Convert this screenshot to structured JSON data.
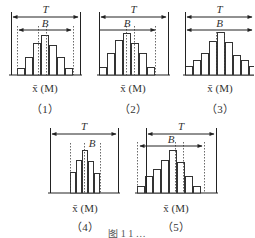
{
  "figure": {
    "panels": [
      {
        "id": "1",
        "tag": "（1）",
        "axis_label": "x̄ (M)",
        "T_label": "T",
        "B_label": "B",
        "solid_left": 11,
        "solid_right": 80,
        "solid_top": 12,
        "baseline": 75,
        "T_arrow": {
          "y": 17,
          "x1": 13,
          "x2": 78,
          "both": true
        },
        "B_arrow": {
          "y": 30,
          "x1": 19,
          "x2": 71,
          "both": true
        },
        "dotted": [
          17,
          38,
          46,
          73
        ],
        "dotted_top": 26,
        "bars": {
          "x0": 17,
          "width": 8,
          "heights": [
            7,
            18,
            32,
            40,
            30,
            18,
            7
          ]
        },
        "axis_label_pos": {
          "x": 45,
          "y": 82
        },
        "tag_pos": {
          "x": 45,
          "y": 100
        }
      },
      {
        "id": "2",
        "tag": "（2）",
        "axis_label": "x̄ (M)",
        "T_label": "T",
        "B_label": "B",
        "solid_left": 99,
        "solid_right": 168,
        "solid_top": 12,
        "baseline": 75,
        "T_arrow": {
          "y": 17,
          "x1": 101,
          "x2": 166,
          "both": true
        },
        "B_arrow": {
          "y": 30,
          "x1": 99,
          "x2": 155,
          "both": false
        },
        "dotted": [
          126,
          134,
          155
        ],
        "dotted_top": 26,
        "bars": {
          "x0": 99,
          "width": 8,
          "heights": [
            8,
            22,
            35,
            42,
            32,
            22,
            8
          ]
        },
        "axis_label_pos": {
          "x": 133,
          "y": 82
        },
        "tag_pos": {
          "x": 133,
          "y": 100
        }
      },
      {
        "id": "3",
        "tag": "（3）",
        "axis_label": "x̄ (M)",
        "T_label": "T",
        "B_label": "B",
        "solid_left": 185,
        "solid_right": null,
        "solid_top": 12,
        "baseline": 75,
        "T_arrow": {
          "y": 17,
          "x1": 187,
          "x2": 252,
          "both": true
        },
        "B_arrow": {
          "y": 30,
          "x1": 187,
          "x2": 252,
          "both": true
        },
        "dotted": [
          216,
          224
        ],
        "dotted_top": 32,
        "bars": {
          "x0": 185,
          "width": 8,
          "heights": [
            9,
            15,
            22,
            34,
            43,
            33,
            20,
            15,
            9
          ]
        },
        "axis_label_pos": {
          "x": 220,
          "y": 82
        },
        "tag_pos": {
          "x": 220,
          "y": 100
        }
      },
      {
        "id": "4",
        "tag": "（4）",
        "axis_label": "x̄ (M)",
        "T_label": "T",
        "B_label": "B",
        "solid_left": 50,
        "solid_right": 118,
        "solid_top": 128,
        "baseline": 193,
        "T_arrow": {
          "y": 134,
          "x1": 52,
          "x2": 116,
          "both": true
        },
        "B_arrow": null,
        "dotted": [
          70,
          84,
          100
        ],
        "dotted_top": 143,
        "bars": {
          "x0": 70,
          "width": 6,
          "heights": [
            21,
            33,
            43,
            32,
            20
          ]
        },
        "axis_label_pos": {
          "x": 85,
          "y": 202
        },
        "tag_pos": {
          "x": 85,
          "y": 218
        }
      },
      {
        "id": "5",
        "tag": "（5）",
        "axis_label": "x̄ (M)",
        "T_label": "T",
        "B_label": "B",
        "solid_left": 146,
        "solid_right": 216,
        "solid_top": 128,
        "baseline": 193,
        "T_arrow": {
          "y": 134,
          "x1": 148,
          "x2": 214,
          "both": true
        },
        "B_arrow": {
          "y": 146,
          "x1": 140,
          "x2": 202,
          "both": true
        },
        "dotted": [
          137,
          175,
          183,
          204
        ],
        "dotted_top": 142,
        "bars": {
          "x0": 137,
          "width": 8,
          "heights": [
            7,
            17,
            24,
            33,
            43,
            31,
            17,
            7
          ]
        },
        "axis_label_pos": {
          "x": 176,
          "y": 202
        },
        "tag_pos": {
          "x": 176,
          "y": 218
        }
      }
    ],
    "caption": "图 1  1  …"
  }
}
